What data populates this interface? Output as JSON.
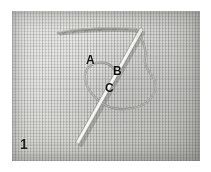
{
  "figure": {
    "number": "1",
    "canvas": {
      "width": 211,
      "height": 172,
      "background": "#ffffff"
    }
  },
  "photo": {
    "name": "fabric-swatch-photo",
    "left": 12,
    "top": 11,
    "width": 188,
    "height": 150,
    "fabric_color": "#d5d5d2",
    "fabric_shadow_color": "#8e8e8b",
    "description": "close-up of plain-weave cloth with visible warp and weft grid"
  },
  "callouts": [
    {
      "id": "a",
      "label": "A",
      "x": 74,
      "y": 43,
      "describes": "thread-emerging-point-left-of-needle"
    },
    {
      "id": "b",
      "label": "B",
      "x": 101,
      "y": 54,
      "describes": "needle-shaft-crossing-loop"
    },
    {
      "id": "c",
      "label": "C",
      "x": 93,
      "y": 71,
      "describes": "lower-loop-crossing-point"
    }
  ],
  "elements": {
    "needle": {
      "name": "sewing-needle",
      "highlight_color": "#f2f2ef",
      "shadow_color": "#8a8a86",
      "tip": {
        "x": 129,
        "y": 19
      },
      "end": {
        "x": 66,
        "y": 131
      }
    },
    "top_thread": {
      "name": "horizontal-thread",
      "color": "#8c8c88",
      "start": {
        "x": 46,
        "y": 21
      },
      "end": {
        "x": 124,
        "y": 18
      }
    },
    "loop_thread": {
      "name": "thread-loop",
      "color": "#9a9a96",
      "description": "loop running from the needle eye around to the right and back down-left"
    }
  }
}
